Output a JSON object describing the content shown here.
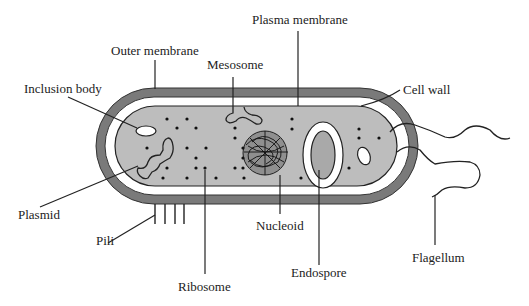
{
  "diagram": {
    "colors": {
      "background": "#ffffff",
      "outer_membrane": "#7a7a7a",
      "cell_wall_gap": "#ffffff",
      "cytoplasm": "#bdbdbd",
      "endospore_core": "#a9a9a9",
      "outline": "#222222",
      "label_text": "#222222"
    },
    "labels": {
      "plasma_membrane": "Plasma membrane",
      "outer_membrane": "Outer membrane",
      "mesosome": "Mesosome",
      "cell_wall": "Cell wall",
      "inclusion_body": "Inclusion body",
      "plasmid": "Plasmid",
      "pili": "Pili",
      "ribosome": "Ribosome",
      "nucleoid": "Nucleoid",
      "endospore": "Endospore",
      "flagellum": "Flagellum"
    }
  }
}
